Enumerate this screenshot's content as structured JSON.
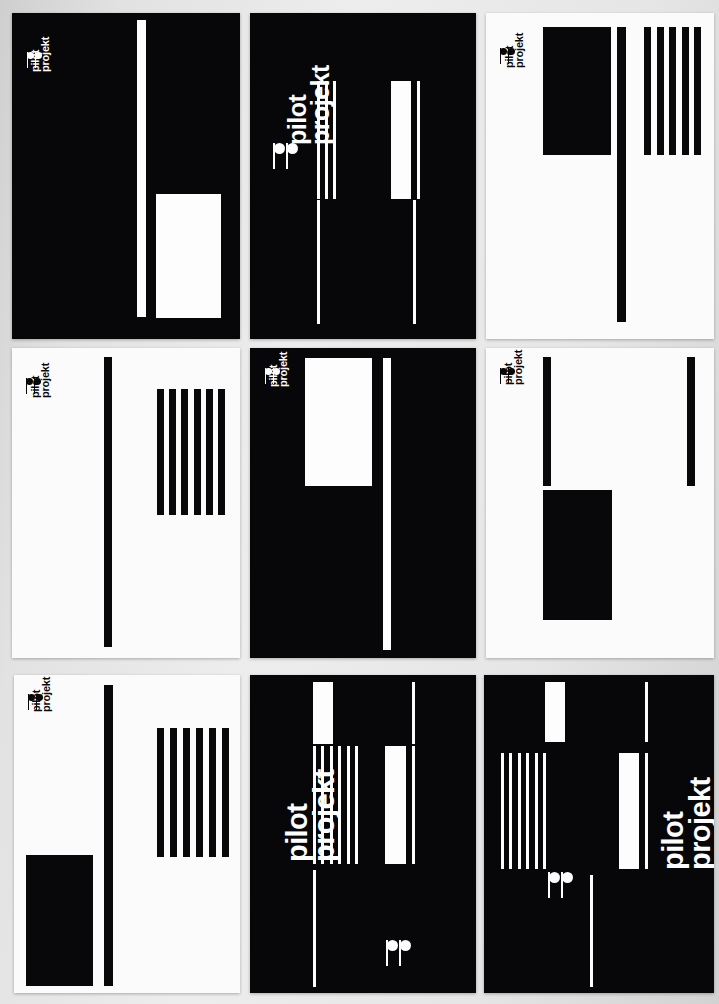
{
  "canvas": {
    "width": 719,
    "height": 1004,
    "background": "#d9d9d9"
  },
  "brand": {
    "name": "pilot projekt",
    "line1": "pilot",
    "line2": "projekt",
    "ink": "#08080b",
    "paper": "#fdfdfd",
    "logo_mark": "two-note-logo-icon"
  },
  "grid": {
    "rows": 3,
    "cols": 3,
    "panel_count": 9
  },
  "panels": [
    {
      "id": "panel-1",
      "position": "top-left",
      "background": "dark",
      "x": 12,
      "y": 13,
      "w": 228,
      "h": 326,
      "wordmark": {
        "present": true,
        "size": "small",
        "color": "on-dark",
        "x": 30,
        "y": 72,
        "font_size": 11
      },
      "logomark": {
        "present": true,
        "color": "on-dark",
        "x": 27,
        "y": 52,
        "scale": 0.62
      },
      "shapes": [
        {
          "name": "tall-white-bar",
          "fill": "white",
          "x": 137,
          "y": 20,
          "w": 9,
          "h": 297
        },
        {
          "name": "white-rectangle",
          "fill": "white",
          "x": 156,
          "y": 194,
          "w": 65,
          "h": 124
        }
      ],
      "stripes": null
    },
    {
      "id": "panel-2",
      "position": "top-center",
      "background": "dark",
      "x": 250,
      "y": 13,
      "w": 226,
      "h": 326,
      "wordmark": {
        "present": true,
        "size": "medium",
        "color": "on-dark",
        "x": 286,
        "y": 145,
        "font_size": 25
      },
      "logomark": {
        "present": true,
        "color": "on-dark",
        "x": 273,
        "y": 143,
        "scale": 1.0
      },
      "shapes": [
        {
          "name": "white-rectangle",
          "fill": "white",
          "x": 391,
          "y": 81,
          "w": 20,
          "h": 118
        },
        {
          "name": "thin-white-bar-right",
          "fill": "white",
          "x": 417,
          "y": 81,
          "w": 3,
          "h": 118
        },
        {
          "name": "long-white-bar-left",
          "fill": "white",
          "x": 317,
          "y": 200,
          "w": 3,
          "h": 124
        },
        {
          "name": "long-white-bar-right",
          "fill": "white",
          "x": 413,
          "y": 200,
          "w": 3,
          "h": 124
        }
      ],
      "stripes": {
        "name": "stripe-group-3",
        "count": 3,
        "fill": "white",
        "x": 317,
        "y": 81,
        "w": 19,
        "h": 118,
        "bar_w": 3
      }
    },
    {
      "id": "panel-3",
      "position": "top-right",
      "background": "light",
      "x": 486,
      "y": 13,
      "w": 228,
      "h": 326,
      "wordmark": {
        "present": true,
        "size": "small",
        "color": "on-light",
        "x": 504,
        "y": 68,
        "font_size": 11
      },
      "logomark": {
        "present": true,
        "color": "on-light",
        "x": 500,
        "y": 48,
        "scale": 0.62
      },
      "shapes": [
        {
          "name": "black-rectangle",
          "fill": "black",
          "x": 543,
          "y": 27,
          "w": 68,
          "h": 128
        },
        {
          "name": "long-black-bar",
          "fill": "black",
          "x": 617,
          "y": 27,
          "w": 9,
          "h": 295
        }
      ],
      "stripes": {
        "name": "stripe-group-5",
        "count": 5,
        "fill": "black",
        "x": 644,
        "y": 27,
        "w": 57,
        "h": 128,
        "bar_w": 7
      }
    },
    {
      "id": "panel-4",
      "position": "middle-left",
      "background": "light",
      "x": 12,
      "y": 348,
      "w": 228,
      "h": 310,
      "wordmark": {
        "present": true,
        "size": "small",
        "color": "on-light",
        "x": 30,
        "y": 398,
        "font_size": 11
      },
      "logomark": {
        "present": true,
        "color": "on-light",
        "x": 26,
        "y": 378,
        "scale": 0.62
      },
      "shapes": [
        {
          "name": "long-black-bar",
          "fill": "black",
          "x": 104,
          "y": 357,
          "w": 8,
          "h": 290
        }
      ],
      "stripes": {
        "name": "stripe-group-6",
        "count": 6,
        "fill": "black",
        "x": 157,
        "y": 389,
        "w": 68,
        "h": 126,
        "bar_w": 7
      }
    },
    {
      "id": "panel-5",
      "position": "middle-center",
      "background": "dark",
      "x": 250,
      "y": 348,
      "w": 226,
      "h": 310,
      "wordmark": {
        "present": true,
        "size": "small",
        "color": "on-dark",
        "x": 268,
        "y": 387,
        "font_size": 11
      },
      "logomark": {
        "present": true,
        "color": "on-dark",
        "x": 265,
        "y": 368,
        "scale": 0.62
      },
      "shapes": [
        {
          "name": "white-rectangle",
          "fill": "white",
          "x": 305,
          "y": 358,
          "w": 67,
          "h": 128
        },
        {
          "name": "long-white-bar",
          "fill": "white",
          "x": 383,
          "y": 358,
          "w": 8,
          "h": 292
        }
      ],
      "stripes": null
    },
    {
      "id": "panel-6",
      "position": "middle-right",
      "background": "light",
      "x": 486,
      "y": 348,
      "w": 228,
      "h": 310,
      "wordmark": {
        "present": true,
        "size": "small",
        "color": "on-light",
        "x": 503,
        "y": 385,
        "font_size": 11
      },
      "logomark": {
        "present": true,
        "color": "on-light",
        "x": 500,
        "y": 368,
        "scale": 0.62
      },
      "shapes": [
        {
          "name": "short-black-bar-left",
          "fill": "black",
          "x": 543,
          "y": 357,
          "w": 8,
          "h": 129
        },
        {
          "name": "short-black-bar-right",
          "fill": "black",
          "x": 687,
          "y": 357,
          "w": 8,
          "h": 129
        },
        {
          "name": "black-rectangle",
          "fill": "black",
          "x": 543,
          "y": 490,
          "w": 69,
          "h": 130
        }
      ],
      "stripes": null
    },
    {
      "id": "panel-7",
      "position": "bottom-left",
      "background": "light",
      "x": 14,
      "y": 675,
      "w": 226,
      "h": 318,
      "wordmark": {
        "present": true,
        "size": "small",
        "color": "on-light",
        "x": 31,
        "y": 712,
        "font_size": 11
      },
      "logomark": {
        "present": true,
        "color": "on-light",
        "x": 28,
        "y": 694,
        "scale": 0.62
      },
      "shapes": [
        {
          "name": "long-black-bar",
          "fill": "black",
          "x": 104,
          "y": 685,
          "w": 9,
          "h": 301
        },
        {
          "name": "black-rectangle",
          "fill": "black",
          "x": 26,
          "y": 855,
          "w": 67,
          "h": 131
        }
      ],
      "stripes": {
        "name": "stripe-group-6",
        "count": 6,
        "fill": "black",
        "x": 157,
        "y": 728,
        "w": 72,
        "h": 129,
        "bar_w": 7
      }
    },
    {
      "id": "panel-8",
      "position": "bottom-center",
      "background": "dark",
      "x": 250,
      "y": 675,
      "w": 226,
      "h": 318,
      "wordmark": {
        "present": true,
        "size": "large",
        "color": "on-dark",
        "x": 284,
        "y": 862,
        "font_size": 29
      },
      "logomark": {
        "present": true,
        "color": "on-dark",
        "x": 386,
        "y": 940,
        "scale": 1.0
      },
      "shapes": [
        {
          "name": "white-rectangle-top",
          "fill": "white",
          "x": 313,
          "y": 682,
          "w": 20,
          "h": 62
        },
        {
          "name": "white-rectangle-right",
          "fill": "white",
          "x": 385,
          "y": 746,
          "w": 21,
          "h": 118
        },
        {
          "name": "thin-white-bar-upper-right",
          "fill": "white",
          "x": 412,
          "y": 682,
          "w": 3,
          "h": 62
        },
        {
          "name": "thin-white-bar-mid-right",
          "fill": "white",
          "x": 412,
          "y": 746,
          "w": 3,
          "h": 118
        },
        {
          "name": "long-white-bar-left",
          "fill": "white",
          "x": 313,
          "y": 870,
          "w": 3,
          "h": 117
        }
      ],
      "stripes": {
        "name": "stripe-group-6",
        "count": 6,
        "fill": "white",
        "x": 313,
        "y": 746,
        "w": 45,
        "h": 118,
        "bar_w": 3
      }
    },
    {
      "id": "panel-9",
      "position": "bottom-right",
      "background": "dark",
      "x": 484,
      "y": 675,
      "w": 230,
      "h": 318,
      "wordmark": {
        "present": true,
        "size": "large",
        "color": "on-dark",
        "x": 660,
        "y": 870,
        "font_size": 29
      },
      "logomark": {
        "present": true,
        "color": "on-dark",
        "x": 548,
        "y": 872,
        "scale": 1.0
      },
      "shapes": [
        {
          "name": "white-rectangle-top",
          "fill": "white",
          "x": 545,
          "y": 682,
          "w": 20,
          "h": 60
        },
        {
          "name": "white-rectangle-right",
          "fill": "white",
          "x": 619,
          "y": 753,
          "w": 20,
          "h": 116
        },
        {
          "name": "thin-white-bar-upper-right",
          "fill": "white",
          "x": 645,
          "y": 682,
          "w": 3,
          "h": 60
        },
        {
          "name": "thin-white-bar-mid-right",
          "fill": "white",
          "x": 645,
          "y": 753,
          "w": 3,
          "h": 116
        },
        {
          "name": "long-white-bar-center",
          "fill": "white",
          "x": 590,
          "y": 875,
          "w": 3,
          "h": 112
        }
      ],
      "stripes": {
        "name": "stripe-group-6",
        "count": 6,
        "fill": "white",
        "x": 501,
        "y": 753,
        "w": 45,
        "h": 116,
        "bar_w": 3
      }
    }
  ]
}
